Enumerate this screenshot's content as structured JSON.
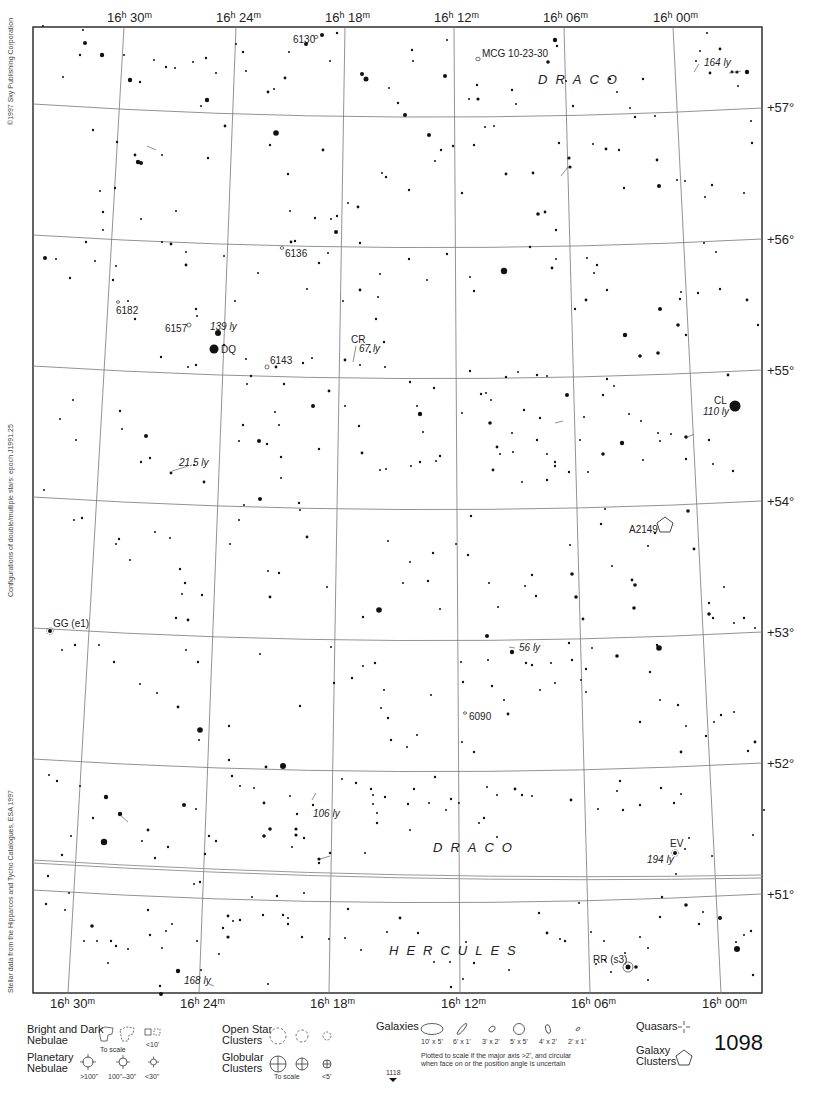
{
  "chart": {
    "page_number": "1098",
    "adjacent_page": "1118",
    "ra_labels": [
      {
        "h": "16",
        "m": "30"
      },
      {
        "h": "16",
        "m": "24"
      },
      {
        "h": "16",
        "m": "18"
      },
      {
        "h": "16",
        "m": "12"
      },
      {
        "h": "16",
        "m": "06"
      },
      {
        "h": "16",
        "m": "00"
      }
    ],
    "dec_labels": [
      "+57°",
      "+56°",
      "+55°",
      "+54°",
      "+53°",
      "+52°",
      "+51°"
    ],
    "constellations": [
      {
        "name": "DRACO",
        "position": "upper-right"
      },
      {
        "name": "DRACO",
        "position": "lower-center"
      },
      {
        "name": "HERCULES",
        "position": "bottom-center"
      }
    ],
    "side_texts": [
      "©1997 Sky Publishing Corporation",
      "Configurations of double/multiple stars: epoch J1991.25",
      "Stellar data from the Hipparcos and Tycho Catalogues, ESA 1997"
    ]
  },
  "objects": {
    "galaxies": [
      "6130",
      "MCG 10-23-30",
      "6136",
      "6182",
      "6157",
      "6143",
      "6090"
    ],
    "galaxy_clusters": [
      "A2149"
    ],
    "variable_stars": [
      "DQ",
      "CR",
      "CL",
      "GG (e1)",
      "EV",
      "RR (s3)"
    ],
    "distances": [
      "164 ly",
      "139 ly",
      "67 ly",
      "110 ly",
      "21.5 ly",
      "56 ly",
      "106 ly",
      "194 ly",
      "168 ly"
    ]
  },
  "legend": {
    "nebulae": {
      "label_line1": "Bright and Dark",
      "label_line2": "Nebulae",
      "to_scale": "To scale",
      "small": "<10'"
    },
    "planetary": {
      "label_line1": "Planetary",
      "label_line2": "Nebulae",
      "sizes": [
        ">100\"",
        "100\"–30\"",
        "<30\""
      ]
    },
    "open_clusters": {
      "label_line1": "Open Star",
      "label_line2": "Clusters"
    },
    "globular_clusters": {
      "label_line1": "Globular",
      "label_line2": "Clusters",
      "to_scale": "To scale",
      "small": "<5'"
    },
    "galaxies": {
      "label": "Galaxies",
      "sizes": [
        "10' x 5'",
        "6' x 1'",
        "3' x 2'",
        "5' x 5'",
        "4' x 2'",
        "2' x 1'"
      ],
      "note_line1": "Plotted to scale if the major axis >2', and circular",
      "note_line2": "when face on or the position angle is uncertain"
    },
    "quasars": {
      "label": "Quasars"
    },
    "galaxy_clusters": {
      "label_line1": "Galaxy",
      "label_line2": "Clusters"
    }
  }
}
